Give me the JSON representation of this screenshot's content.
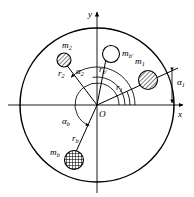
{
  "figure": {
    "background_color": "#ffffff",
    "line_color": "#000000",
    "width": 194,
    "height": 197
  },
  "axes": {
    "y_label": "y",
    "x_label": "x",
    "origin_label": "O"
  },
  "masses": [
    {
      "id": "m1",
      "mass_label": "m",
      "mass_sub": "1",
      "radius_label": "r",
      "radius_sub": "1",
      "angle_label": "α",
      "angle_sub": "1",
      "fill": "hatch-diagonal",
      "cx": 148,
      "cy": 80,
      "r": 9.5,
      "angle_deg": 24
    },
    {
      "id": "m2",
      "mass_label": "m",
      "mass_sub": "2",
      "radius_label": "r",
      "radius_sub": "2",
      "angle_label": "α",
      "angle_sub": "2",
      "fill": "hatch-diagonal",
      "cx": 64,
      "cy": 60,
      "r": 7.0,
      "angle_deg": 133
    },
    {
      "id": "mb_prime",
      "mass_label": "m",
      "mass_sub": "b′",
      "radius_label": "r",
      "radius_sub": "b′",
      "angle_label": "",
      "angle_sub": "",
      "fill": "none",
      "cx": 111,
      "cy": 54,
      "r": 8.5,
      "angle_deg": 99
    },
    {
      "id": "mb",
      "mass_label": "m",
      "mass_sub": "b",
      "radius_label": "r",
      "radius_sub": "b",
      "angle_label": "α",
      "angle_sub": "b",
      "fill": "hatch-cross",
      "cx": 74,
      "cy": 160,
      "r": 9.5,
      "angle_deg": 249
    }
  ],
  "labels": {
    "m1": "m",
    "m1_sub": "1",
    "r1": "r",
    "r1_sub": "1",
    "a1": "α",
    "a1_sub": "1",
    "m2": "m",
    "m2_sub": "2",
    "r2": "r",
    "r2_sub": "2",
    "a2": "α",
    "a2_sub": "2",
    "mbp": "m",
    "mbp_sub": "b′",
    "rbp": "r",
    "rbp_sub": "b′",
    "mb": "m",
    "mb_sub": "b",
    "rb": "r",
    "rb_sub": "b",
    "ab": "α",
    "ab_sub": "b"
  }
}
